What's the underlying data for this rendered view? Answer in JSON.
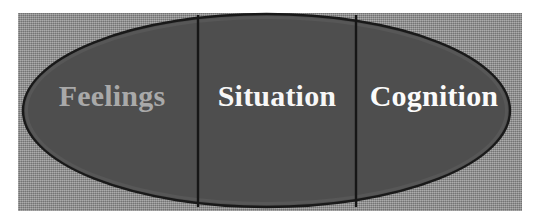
{
  "figure": {
    "type": "ellipse-three-segment-diagram",
    "canvas": {
      "width": 538,
      "height": 222,
      "background": "#ffffff"
    },
    "panel": {
      "name": "background-panel",
      "fill": "#8e8e8e",
      "texture": "halftone-dither",
      "x": 18,
      "y": 13,
      "width": 504,
      "height": 198
    },
    "ellipse": {
      "name": "main-ellipse",
      "fill": "#4e4e4e",
      "stroke": "#191919",
      "stroke_width": 2,
      "cx": 266.5,
      "cy": 110.5,
      "rx": 243.5,
      "ry": 96.5
    },
    "dividers": [
      {
        "name": "divider-left",
        "x": 198,
        "y1": 15,
        "y2": 207,
        "stroke": "#161616",
        "stroke_width": 2
      },
      {
        "name": "divider-right",
        "x": 356,
        "y1": 15,
        "y2": 207,
        "stroke": "#161616",
        "stroke_width": 2
      }
    ],
    "segments": [
      {
        "id": "feelings",
        "label": "Feelings",
        "color": "#a9a9a9",
        "center_x": 112
      },
      {
        "id": "situation",
        "label": "Situation",
        "color": "#f7f7f7",
        "center_x": 277
      },
      {
        "id": "cognition",
        "label": "Cognition",
        "color": "#fbfbfb",
        "center_x": 434
      }
    ]
  }
}
